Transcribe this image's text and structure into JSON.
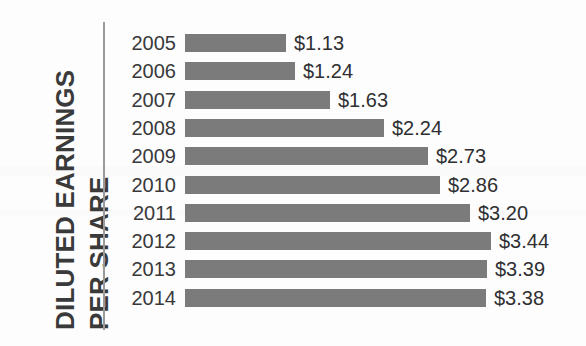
{
  "axis_title": {
    "line1": "DILUTED EARNINGS",
    "line2": "PER SHARE",
    "full": "DILUTED EARNINGS PER SHARE"
  },
  "colors": {
    "bar": "#7b7b7b",
    "axis_line": "#9a9a9a",
    "text": "#2f2f31",
    "title": "#3a3a3a",
    "background": "#fdfdfd"
  },
  "rows": [
    {
      "year": "2005",
      "value_label": "$1.13",
      "value": 1.13
    },
    {
      "year": "2006",
      "value_label": "$1.24",
      "value": 1.24
    },
    {
      "year": "2007",
      "value_label": "$1.63",
      "value": 1.63
    },
    {
      "year": "2008",
      "value_label": "$2.24",
      "value": 2.24
    },
    {
      "year": "2009",
      "value_label": "$2.73",
      "value": 2.73
    },
    {
      "year": "2010",
      "value_label": "$2.86",
      "value": 2.86
    },
    {
      "year": "2011",
      "value_label": "$3.20",
      "value": 3.2
    },
    {
      "year": "2012",
      "value_label": "$3.44",
      "value": 3.44
    },
    {
      "year": "2013",
      "value_label": "$3.39",
      "value": 3.39
    },
    {
      "year": "2014",
      "value_label": "$3.38",
      "value": 3.38
    }
  ],
  "chart_data": {
    "type": "bar",
    "orientation": "horizontal",
    "title": "",
    "xlabel": "",
    "ylabel": "DILUTED EARNINGS PER SHARE",
    "categories": [
      "2005",
      "2006",
      "2007",
      "2008",
      "2009",
      "2010",
      "2011",
      "2012",
      "2013",
      "2014"
    ],
    "values": [
      1.13,
      1.24,
      1.63,
      2.24,
      2.73,
      2.86,
      3.2,
      3.44,
      3.39,
      3.38
    ],
    "data_labels": [
      "$1.13",
      "$1.24",
      "$1.63",
      "$2.24",
      "$2.73",
      "$2.86",
      "$3.20",
      "$3.44",
      "$3.39",
      "$3.38"
    ],
    "xlim": [
      0,
      3.44
    ],
    "grid": false,
    "legend": false,
    "units": "USD per share"
  },
  "layout": {
    "bar_origin_px": 77,
    "px_per_unit": 89.0,
    "row_pitch_px": 28.3,
    "bar_height_px": 18
  }
}
